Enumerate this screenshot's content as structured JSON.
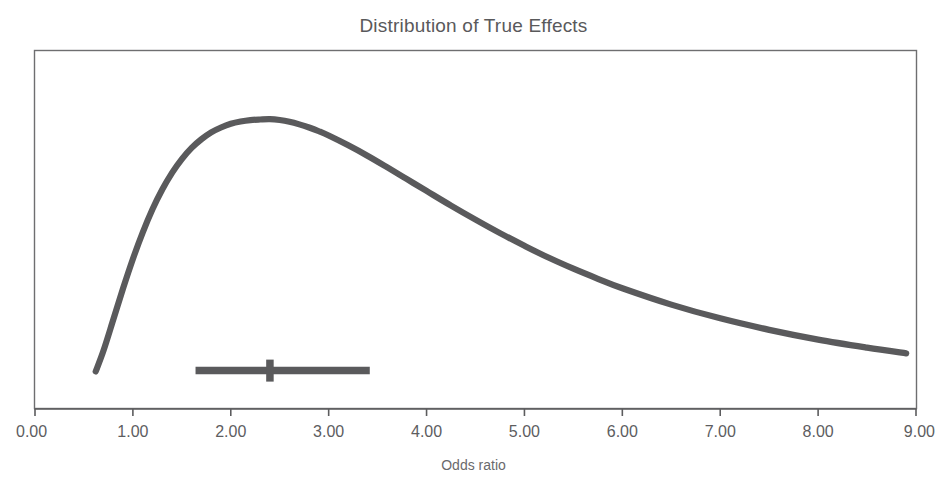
{
  "chart_data": {
    "type": "line",
    "title": "Distribution of True Effects",
    "xlabel": "Odds ratio",
    "ylabel": "",
    "xlim": [
      0.0,
      9.0
    ],
    "ylim": [
      0.0,
      1.0
    ],
    "xticks": [
      0.0,
      1.0,
      2.0,
      3.0,
      4.0,
      5.0,
      6.0,
      7.0,
      8.0,
      9.0
    ],
    "xtick_labels": [
      "0.00",
      "1.00",
      "2.00",
      "3.00",
      "4.00",
      "5.00",
      "6.00",
      "7.00",
      "8.00",
      "9.00"
    ],
    "yticks": [],
    "ytick_labels": [],
    "grid": false,
    "legend": false,
    "series": [
      {
        "name": "density-of-true-effects",
        "type": "line",
        "color": "#5a5a5c",
        "linewidth": 6.2,
        "x": [
          0.62,
          0.7,
          0.8,
          0.9,
          1.0,
          1.1,
          1.2,
          1.3,
          1.4,
          1.5,
          1.6,
          1.7,
          1.8,
          1.9,
          2.0,
          2.1,
          2.2,
          2.3,
          2.4,
          2.5,
          2.6,
          2.7,
          2.8,
          2.9,
          3.0,
          3.2,
          3.4,
          3.6,
          3.8,
          4.0,
          4.25,
          4.5,
          4.75,
          5.0,
          5.25,
          5.5,
          5.75,
          6.0,
          6.5,
          7.0,
          7.5,
          8.0,
          8.5,
          8.9
        ],
        "y": [
          0.082,
          0.155,
          0.263,
          0.372,
          0.474,
          0.566,
          0.647,
          0.716,
          0.774,
          0.822,
          0.861,
          0.891,
          0.915,
          0.932,
          0.945,
          0.953,
          0.958,
          0.96,
          0.961,
          0.958,
          0.952,
          0.943,
          0.932,
          0.919,
          0.904,
          0.87,
          0.833,
          0.793,
          0.752,
          0.711,
          0.66,
          0.611,
          0.564,
          0.52,
          0.478,
          0.44,
          0.405,
          0.372,
          0.315,
          0.267,
          0.227,
          0.193,
          0.165,
          0.145
        ]
      }
    ],
    "annotations": [
      {
        "name": "confidence-interval-bar",
        "type": "errorbar",
        "orientation": "horizontal",
        "estimate": 2.4,
        "low": 1.64,
        "high": 3.42,
        "y_position": 0.085,
        "color": "#5a5a5c"
      }
    ]
  },
  "figure": {
    "background": "#ffffff",
    "frame_color": "#6e6e70",
    "text_color": "#59595b"
  }
}
